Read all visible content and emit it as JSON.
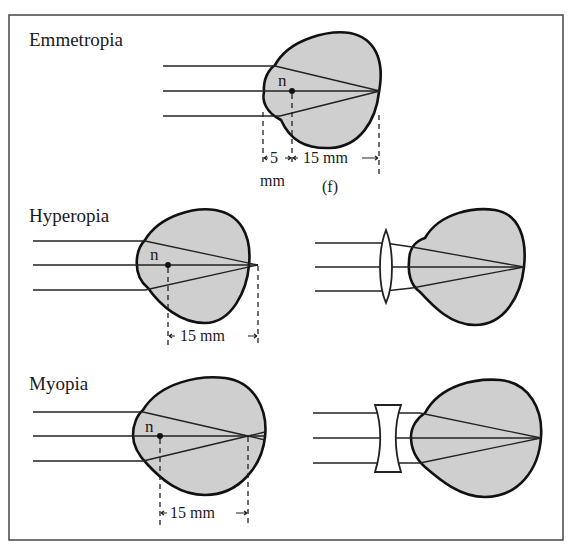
{
  "figure": {
    "panels": [
      {
        "id": "emmetropia",
        "title": "Emmetropia",
        "nodal_point_label": "n",
        "dimensions": [
          {
            "label_line1": "5",
            "label_line2": "mm"
          },
          {
            "label_line1": "15 mm",
            "label_line2": "(f)"
          }
        ]
      },
      {
        "id": "hyperopia",
        "title": "Hyperopia",
        "nodal_point_label": "n",
        "dimensions": [
          {
            "label_line1": "15 mm"
          }
        ],
        "correction": "convex-lens"
      },
      {
        "id": "myopia",
        "title": "Myopia",
        "nodal_point_label": "n",
        "dimensions": [
          {
            "label_line1": "15 mm"
          }
        ],
        "correction": "concave-lens"
      }
    ],
    "colors": {
      "eye_fill": "#cfcfcf",
      "outline": "#111111",
      "background": "#ffffff"
    }
  }
}
